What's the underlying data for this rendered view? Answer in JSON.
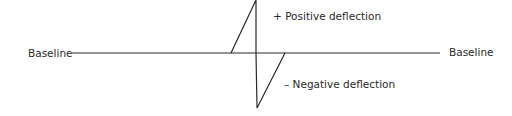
{
  "diagram": {
    "labels": {
      "baseline_left": "Baseline",
      "baseline_right": "Baseline",
      "positive": "+ Positive deflection",
      "negative": "– Negative deflection"
    },
    "colors": {
      "line": "#2a2a2a",
      "text": "#2a2a2a",
      "background": "#ffffff"
    },
    "geometry": {
      "baseline_y": 53,
      "baseline_x_start": 72,
      "baseline_x_end": 440,
      "positive_peak": [
        256,
        0
      ],
      "negative_trough": [
        257,
        108
      ],
      "positive_rise_start_x": 231,
      "negative_return_x": 285
    }
  }
}
